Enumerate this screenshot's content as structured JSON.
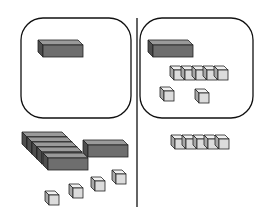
{
  "diagram": {
    "type": "base-ten-blocks",
    "colors": {
      "rod_front": "#6e6e6e",
      "rod_top": "#9a9a9a",
      "rod_side": "#4e4e4e",
      "unit_front": "#dcdcdc",
      "unit_top": "#f0f0f0",
      "unit_side": "#a8a8a8",
      "outline": "#222222",
      "frame": "#111111"
    },
    "left_region": {
      "box": {
        "rods": 1,
        "units": 0
      },
      "outside": {
        "rods": 6,
        "units": 4
      }
    },
    "right_region": {
      "box": {
        "rods": 1,
        "units": 7
      },
      "outside": {
        "rods": 0,
        "units": 5
      }
    }
  }
}
